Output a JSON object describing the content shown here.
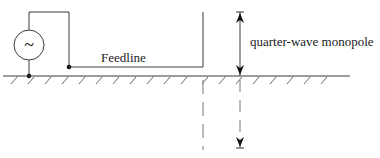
{
  "diagram": {
    "labels": {
      "feedline": "Feedline",
      "monopole": "quarter-wave monopole",
      "generator_symbol": "~"
    },
    "components": [
      "ac-source",
      "feedline",
      "ground-plane",
      "quarter-wave-monopole",
      "image-monopole"
    ],
    "colors": {
      "stroke": "#3a3a3a",
      "background": "#ffffff"
    }
  }
}
